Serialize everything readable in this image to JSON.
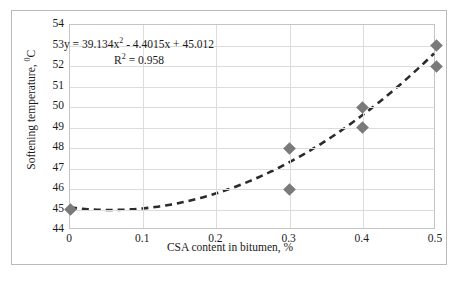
{
  "chart_data": {
    "type": "scatter",
    "title": "",
    "xlabel": "CSA content in bitumen, %",
    "ylabel": "Softening temperature, ⁰C",
    "ylabel_text": "Softening temperature, ",
    "ylabel_sup": "0",
    "ylabel_unit": "C",
    "xlim": [
      0,
      0.5
    ],
    "ylim": [
      44,
      54
    ],
    "grid": true,
    "legend": false,
    "xticks": [
      "0",
      "0.1",
      "0.2",
      "0.3",
      "0.4",
      "0.5"
    ],
    "xtick_values": [
      0,
      0.1,
      0.2,
      0.3,
      0.4,
      0.5
    ],
    "yticks": [
      "44",
      "45",
      "46",
      "47",
      "48",
      "49",
      "50",
      "51",
      "52",
      "53",
      "54"
    ],
    "ytick_values": [
      44,
      45,
      46,
      47,
      48,
      49,
      50,
      51,
      52,
      53,
      54
    ],
    "series": [
      {
        "name": "Softening temperature",
        "marker": "diamond",
        "color": "#7a7a7a",
        "points": [
          {
            "x": 0,
            "y": 45
          },
          {
            "x": 0.3,
            "y": 48
          },
          {
            "x": 0.3,
            "y": 46
          },
          {
            "x": 0.4,
            "y": 50
          },
          {
            "x": 0.4,
            "y": 49
          },
          {
            "x": 0.5,
            "y": 53
          },
          {
            "x": 0.5,
            "y": 52
          }
        ]
      }
    ],
    "trendline": {
      "type": "polynomial",
      "order": 2,
      "style": "dashed",
      "color": "#2b2b2b",
      "coefficients": {
        "a": 39.134,
        "b": -4.4015,
        "c": 45.012
      },
      "r_squared": 0.958
    },
    "annotations": {
      "equation_prefix": "y = 39.134x",
      "equation_sup": "2",
      "equation_suffix": " - 4.4015x + 45.012",
      "r2_prefix": "R",
      "r2_sup": "2",
      "r2_suffix": " = 0.958"
    },
    "colors": {
      "marker": "#7a7a7a",
      "trendline": "#2b2b2b",
      "gridline": "#dcdcdc",
      "plot_border": "#c4c4c4",
      "figure_border": "#b9b9b9",
      "background": "#ffffff",
      "text": "#1a1a1a"
    }
  }
}
